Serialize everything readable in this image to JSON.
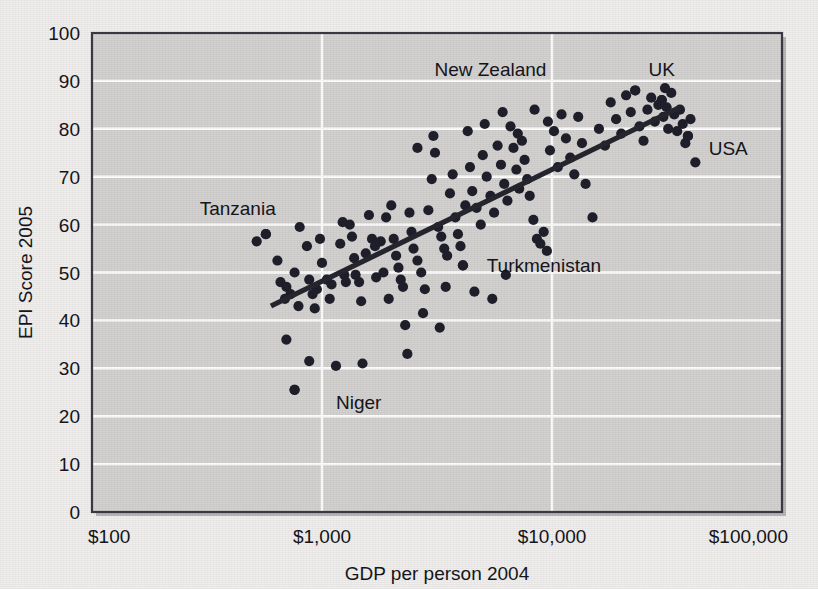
{
  "chart_data": {
    "type": "scatter",
    "title": "",
    "xlabel": "GDP per person 2004",
    "ylabel": "EPI Score 2005",
    "xscale": "log",
    "xlim": [
      100,
      100000
    ],
    "ylim": [
      0,
      100
    ],
    "xticks": [
      "$100",
      "$1,000",
      "$10,000",
      "$100,000"
    ],
    "xtick_values": [
      100,
      1000,
      10000,
      100000
    ],
    "yticks": [
      "0",
      "10",
      "20",
      "30",
      "40",
      "50",
      "60",
      "70",
      "80",
      "90",
      "100"
    ],
    "ytick_values": [
      0,
      10,
      20,
      30,
      40,
      50,
      60,
      70,
      80,
      90,
      100
    ],
    "grid": "horizontal-and-vertical-white",
    "legend": "none",
    "point_color": "#20202c",
    "plot_bg": "#d4d3d1",
    "page_bg": "#f1f0ee",
    "trendline": {
      "label": "linear fit (log GDP vs EPI)",
      "color": "#26262f",
      "x_start": 600,
      "y_start": 43,
      "x_end": 36000,
      "y_end": 84.5
    },
    "annotations": [
      {
        "label": "Tanzania",
        "x": 570,
        "y": 58,
        "label_x": 430,
        "label_y": 63.5
      },
      {
        "label": "Niger",
        "x": 760,
        "y": 25.5,
        "label_x": 1150,
        "label_y": 23
      },
      {
        "label": "Turkmenistan",
        "x": 4100,
        "y": 51.5,
        "label_x": 5200,
        "label_y": 51.5
      },
      {
        "label": "New Zealand",
        "x": 23000,
        "y": 88,
        "label_x": 5400,
        "label_y": 92.5
      },
      {
        "label": "UK",
        "x": 30000,
        "y": 86,
        "label_x": 30000,
        "label_y": 92.5
      },
      {
        "label": "USA",
        "x": 39000,
        "y": 78.5,
        "label_x": 48000,
        "label_y": 76
      }
    ],
    "points": [
      [
        520,
        56.5
      ],
      [
        570,
        58.0
      ],
      [
        640,
        52.5
      ],
      [
        660,
        48.0
      ],
      [
        700,
        47.0
      ],
      [
        690,
        44.5
      ],
      [
        730,
        45.5
      ],
      [
        760,
        50.0
      ],
      [
        790,
        43.0
      ],
      [
        800,
        59.5
      ],
      [
        700,
        36.0
      ],
      [
        760,
        25.5
      ],
      [
        860,
        55.5
      ],
      [
        880,
        48.5
      ],
      [
        910,
        45.5
      ],
      [
        930,
        42.5
      ],
      [
        950,
        46.5
      ],
      [
        880,
        31.5
      ],
      [
        980,
        57.0
      ],
      [
        1000,
        52.0
      ],
      [
        1050,
        48.5
      ],
      [
        1080,
        44.5
      ],
      [
        1100,
        47.5
      ],
      [
        1150,
        30.5
      ],
      [
        1200,
        56.0
      ],
      [
        1230,
        60.5
      ],
      [
        1250,
        49.5
      ],
      [
        1270,
        48.0
      ],
      [
        1320,
        60.0
      ],
      [
        1350,
        57.5
      ],
      [
        1380,
        53.0
      ],
      [
        1400,
        49.5
      ],
      [
        1450,
        48.0
      ],
      [
        1480,
        44.0
      ],
      [
        1500,
        31.0
      ],
      [
        1550,
        54.0
      ],
      [
        1600,
        62.0
      ],
      [
        1650,
        57.0
      ],
      [
        1700,
        55.5
      ],
      [
        1720,
        49.0
      ],
      [
        1800,
        56.5
      ],
      [
        1850,
        50.0
      ],
      [
        1900,
        61.5
      ],
      [
        1950,
        44.5
      ],
      [
        2000,
        64.0
      ],
      [
        2050,
        57.0
      ],
      [
        2100,
        53.5
      ],
      [
        2150,
        51.0
      ],
      [
        2200,
        48.5
      ],
      [
        2250,
        47.0
      ],
      [
        2300,
        39.0
      ],
      [
        2350,
        33.0
      ],
      [
        2400,
        62.5
      ],
      [
        2450,
        58.5
      ],
      [
        2500,
        55.0
      ],
      [
        2600,
        52.5
      ],
      [
        2700,
        50.0
      ],
      [
        2800,
        46.5
      ],
      [
        2900,
        63.0
      ],
      [
        3000,
        69.5
      ],
      [
        3100,
        75.0
      ],
      [
        3200,
        59.5
      ],
      [
        3300,
        57.5
      ],
      [
        3400,
        55.0
      ],
      [
        3500,
        53.5
      ],
      [
        3600,
        66.5
      ],
      [
        3700,
        70.5
      ],
      [
        3800,
        61.5
      ],
      [
        3900,
        58.0
      ],
      [
        4000,
        55.5
      ],
      [
        4100,
        51.5
      ],
      [
        4200,
        64.0
      ],
      [
        4400,
        72.0
      ],
      [
        4500,
        67.0
      ],
      [
        4700,
        63.5
      ],
      [
        4900,
        60.0
      ],
      [
        5000,
        74.5
      ],
      [
        5200,
        70.0
      ],
      [
        5400,
        66.0
      ],
      [
        5600,
        62.5
      ],
      [
        5800,
        76.5
      ],
      [
        6000,
        72.5
      ],
      [
        6200,
        68.5
      ],
      [
        6400,
        65.0
      ],
      [
        6600,
        80.5
      ],
      [
        6800,
        76.0
      ],
      [
        7000,
        71.5
      ],
      [
        7200,
        67.5
      ],
      [
        7400,
        77.5
      ],
      [
        7600,
        73.5
      ],
      [
        7800,
        69.5
      ],
      [
        8000,
        66.0
      ],
      [
        8300,
        61.0
      ],
      [
        8600,
        57.0
      ],
      [
        8900,
        56.0
      ],
      [
        9200,
        58.5
      ],
      [
        9500,
        54.5
      ],
      [
        9800,
        75.5
      ],
      [
        10200,
        79.5
      ],
      [
        10600,
        72.0
      ],
      [
        11000,
        83.0
      ],
      [
        11500,
        78.0
      ],
      [
        12000,
        74.0
      ],
      [
        12500,
        70.5
      ],
      [
        13000,
        82.5
      ],
      [
        13500,
        77.0
      ],
      [
        14000,
        68.5
      ],
      [
        15000,
        61.5
      ],
      [
        16000,
        80.0
      ],
      [
        17000,
        76.5
      ],
      [
        18000,
        85.5
      ],
      [
        19000,
        82.0
      ],
      [
        20000,
        79.0
      ],
      [
        21000,
        87.0
      ],
      [
        22000,
        83.5
      ],
      [
        23000,
        88.0
      ],
      [
        24000,
        80.5
      ],
      [
        25000,
        77.5
      ],
      [
        26000,
        84.0
      ],
      [
        27000,
        86.5
      ],
      [
        28000,
        81.5
      ],
      [
        29000,
        85.0
      ],
      [
        30000,
        86.0
      ],
      [
        30500,
        82.5
      ],
      [
        31000,
        88.5
      ],
      [
        31500,
        84.5
      ],
      [
        32000,
        80.0
      ],
      [
        33000,
        87.5
      ],
      [
        34000,
        83.0
      ],
      [
        35000,
        79.5
      ],
      [
        36000,
        84.0
      ],
      [
        37000,
        81.0
      ],
      [
        38000,
        77.0
      ],
      [
        39000,
        78.5
      ],
      [
        40000,
        82.0
      ],
      [
        42000,
        73.0
      ],
      [
        2600,
        76.0
      ],
      [
        3050,
        78.5
      ],
      [
        4300,
        79.5
      ],
      [
        5100,
        81.0
      ],
      [
        6100,
        83.5
      ],
      [
        7100,
        79.0
      ],
      [
        8400,
        84.0
      ],
      [
        9600,
        81.5
      ],
      [
        3450,
        47.0
      ],
      [
        4600,
        46.0
      ],
      [
        5500,
        44.5
      ],
      [
        6300,
        49.5
      ],
      [
        2750,
        41.5
      ],
      [
        3250,
        38.5
      ]
    ]
  }
}
